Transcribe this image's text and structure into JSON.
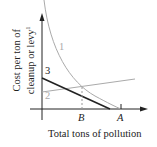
{
  "diagram": {
    "ylabel_line1": "Cost per ton of",
    "ylabel_line2": "cleanup or levy",
    "ylabel_sup": "1",
    "xlabel": "Total tons of pollution",
    "x_ticks": [
      "B",
      "A"
    ],
    "curves": [
      {
        "label": "1",
        "description": "marginal cleanup cost curve (gray, convex, falling to A)",
        "color": "#aaaaaa"
      },
      {
        "label": "2",
        "description": "upward-sloping gray line",
        "color": "#aaaaaa"
      },
      {
        "label": "3",
        "description": "downward-sloping black line",
        "color": "#222222"
      }
    ],
    "axis_color": "#222222"
  }
}
